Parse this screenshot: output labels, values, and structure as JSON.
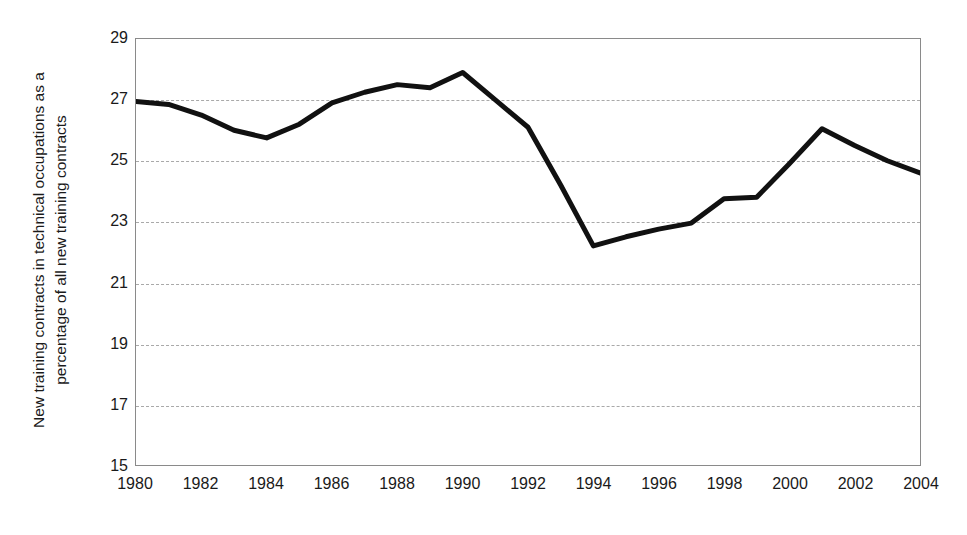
{
  "chart_data": {
    "type": "line",
    "title": "",
    "xlabel": "",
    "ylabel": "New training contracts in technical occupations as a percentage of all new training contracts",
    "ylabel_lines": [
      "New training contracts in technical occupations as a",
      "percentage of all new training contracts"
    ],
    "xlim": [
      1980,
      2004
    ],
    "ylim": [
      15,
      29
    ],
    "ytick_labels": [
      "29",
      "27",
      "25",
      "23",
      "21",
      "19",
      "17",
      "15"
    ],
    "yticks": [
      29,
      27,
      25,
      23,
      21,
      19,
      17,
      15
    ],
    "xtick_labels": [
      "1980",
      "1982",
      "1984",
      "1986",
      "1988",
      "1990",
      "1992",
      "1994",
      "1996",
      "1998",
      "2000",
      "2002",
      "2004"
    ],
    "xticks": [
      1980,
      1982,
      1984,
      1986,
      1988,
      1990,
      1992,
      1994,
      1996,
      1998,
      2000,
      2002,
      2004
    ],
    "grid": true,
    "grid_axis": "y",
    "grid_style": "dashed",
    "grid_color": "#a9a9a9",
    "legend": false,
    "legend_position": "none",
    "line_color": "#111111",
    "line_width": 5,
    "background_color": "#ffffff",
    "frame_color": "#8a8a8a",
    "x": [
      1980,
      1981,
      1982,
      1983,
      1984,
      1985,
      1986,
      1987,
      1988,
      1989,
      1990,
      1991,
      1992,
      1993,
      1994,
      1995,
      1996,
      1997,
      1998,
      1999,
      2000,
      2001,
      2002,
      2003,
      2004
    ],
    "values": [
      26.95,
      26.85,
      26.5,
      26.0,
      25.75,
      26.2,
      26.9,
      27.25,
      27.5,
      27.4,
      27.9,
      27.0,
      26.1,
      24.2,
      22.2,
      22.5,
      22.75,
      22.95,
      23.75,
      23.8,
      24.9,
      26.05,
      25.5,
      25.0,
      24.6
    ],
    "series": [
      {
        "name": "New training contracts in technical occupations (%)",
        "values": [
          26.95,
          26.85,
          26.5,
          26.0,
          25.75,
          26.2,
          26.9,
          27.25,
          27.5,
          27.4,
          27.9,
          27.0,
          26.1,
          24.2,
          22.2,
          22.5,
          22.75,
          22.95,
          23.75,
          23.8,
          24.9,
          26.05,
          25.5,
          25.0,
          24.6
        ]
      }
    ],
    "annotations": []
  }
}
